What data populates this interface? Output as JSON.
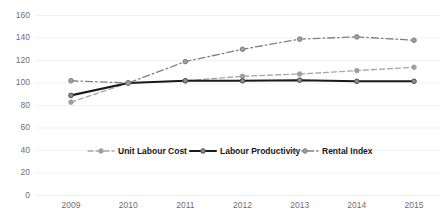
{
  "chart_data": {
    "type": "line",
    "title": "",
    "subtitle": "",
    "xlabel": "",
    "ylabel": "",
    "categories": [
      "2009",
      "2010",
      "2011",
      "2012",
      "2013",
      "2014",
      "2015"
    ],
    "ylim": [
      0,
      160
    ],
    "ytick_values": [
      0,
      20,
      40,
      60,
      80,
      100,
      120,
      140,
      160
    ],
    "ytick_labels": [
      "0",
      "20",
      "40",
      "60",
      "80",
      "100",
      "120",
      "140",
      "160"
    ],
    "grid": true,
    "grid_axis": "y",
    "legend_position": "inside-center",
    "series": [
      {
        "name": "Unit Labour Cost",
        "values": [
          83,
          100,
          102,
          106,
          108,
          111,
          114
        ],
        "color": "#A6A6A6",
        "linestyle": "dashed",
        "marker": "circle",
        "linewidth": 1.3
      },
      {
        "name": "Labour Productivity",
        "values": [
          89,
          100,
          102,
          102,
          102.5,
          101.5,
          101.5
        ],
        "color": "#1A1A1A",
        "linestyle": "solid",
        "marker": "circle",
        "linewidth": 2.1
      },
      {
        "name": "Rental Index",
        "values": [
          102,
          100,
          119,
          130,
          139,
          141,
          138
        ],
        "color": "#808080",
        "linestyle": "dashdot",
        "marker": "circle",
        "linewidth": 1.3
      }
    ]
  },
  "legend": {
    "items": [
      {
        "label": "Unit Labour Cost"
      },
      {
        "label": "Labour Productivity"
      },
      {
        "label": "Rental Index"
      }
    ]
  },
  "axes": {
    "y_labels": [
      "160",
      "140",
      "120",
      "100",
      "80",
      "60",
      "40",
      "20",
      "0"
    ],
    "x_labels": [
      "2009",
      "2010",
      "2011",
      "2012",
      "2013",
      "2014",
      "2015"
    ]
  },
  "colors": {
    "background": "#ffffff",
    "grid": "#f1f1f1",
    "tick_text": "#6f6f6f",
    "legend_text": "#1a1a1a",
    "unit_labour_cost": "#A6A6A6",
    "labour_productivity": "#1A1A1A",
    "rental_index": "#808080"
  }
}
